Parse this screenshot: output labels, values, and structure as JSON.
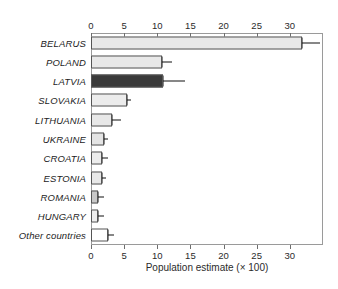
{
  "chart_data": {
    "type": "bar",
    "orientation": "horizontal",
    "title": "",
    "xlabel": "Population estimate (× 100)",
    "ylabel": "",
    "xlim": [
      0,
      35
    ],
    "grid": false,
    "legend": null,
    "axes": {
      "top_axis": true,
      "bottom_axis": true,
      "tick_values": [
        0,
        5,
        10,
        15,
        20,
        25,
        30
      ],
      "tick_labels": [
        "0",
        "5",
        "10",
        "15",
        "20",
        "25",
        "30"
      ]
    },
    "categories": [
      "BELARUS",
      "POLAND",
      "LATVIA",
      "SLOVAKIA",
      "LITHUANIA",
      "UKRAINE",
      "CROATIA",
      "ESTONIA",
      "ROMANIA",
      "HUNGARY",
      "Other countries"
    ],
    "values": [
      31.8,
      10.7,
      10.8,
      5.4,
      3.2,
      2.0,
      1.7,
      1.6,
      1.1,
      1.0,
      2.5
    ],
    "error_upper": [
      34.5,
      12.2,
      14.2,
      6.0,
      4.6,
      2.6,
      2.5,
      2.3,
      2.0,
      2.0,
      3.4
    ],
    "bar_colors": [
      "#e8e8e8",
      "#e8e8e8",
      "#3a3a3a",
      "#ececec",
      "#e8e8e8",
      "#e4e4e4",
      "#ececec",
      "#e8e8e8",
      "#c8c8c8",
      "#ededed",
      "#ffffff"
    ],
    "bars": [
      {
        "category": "BELARUS",
        "value": 31.8,
        "error_upper": 34.5,
        "color": "#e8e8e8"
      },
      {
        "category": "POLAND",
        "value": 10.7,
        "error_upper": 12.2,
        "color": "#e8e8e8"
      },
      {
        "category": "LATVIA",
        "value": 10.8,
        "error_upper": 14.2,
        "color": "#3a3a3a"
      },
      {
        "category": "SLOVAKIA",
        "value": 5.4,
        "error_upper": 6.0,
        "color": "#ececec"
      },
      {
        "category": "LITHUANIA",
        "value": 3.2,
        "error_upper": 4.6,
        "color": "#e8e8e8"
      },
      {
        "category": "UKRAINE",
        "value": 2.0,
        "error_upper": 2.6,
        "color": "#e4e4e4"
      },
      {
        "category": "CROATIA",
        "value": 1.7,
        "error_upper": 2.5,
        "color": "#ececec"
      },
      {
        "category": "ESTONIA",
        "value": 1.6,
        "error_upper": 2.3,
        "color": "#e8e8e8"
      },
      {
        "category": "ROMANIA",
        "value": 1.1,
        "error_upper": 2.0,
        "color": "#c8c8c8"
      },
      {
        "category": "HUNGARY",
        "value": 1.0,
        "error_upper": 2.0,
        "color": "#ededed"
      },
      {
        "category": "Other countries",
        "value": 2.5,
        "error_upper": 3.4,
        "color": "#ffffff"
      }
    ]
  },
  "colors": {
    "highlight_bar": "#3a3a3a",
    "default_bar": "#e8e8e8",
    "bar_outline": "#555555",
    "axis": "#9a9a9a",
    "text": "#1c1c1c",
    "background": "#ffffff"
  }
}
